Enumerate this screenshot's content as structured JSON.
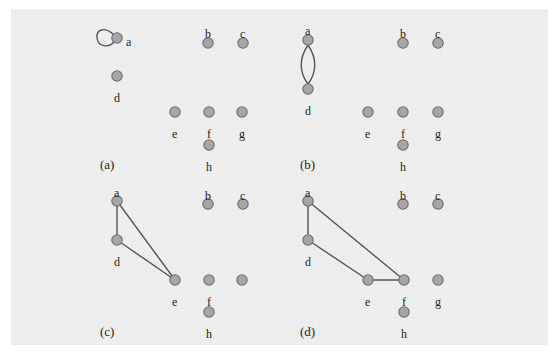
{
  "figure": {
    "background_color": "#eeeeee",
    "page_color": "#ffffff",
    "node_fill": "#a6a6a6",
    "node_stroke": "#6e6e6e",
    "edge_color": "#555555",
    "label_color": "#1c1c1c",
    "node_radius": 5.2,
    "panels": [
      {
        "id": "panel-a",
        "caption": "(a)",
        "caption_x": 100,
        "caption_y": 158,
        "nodes": [
          {
            "id": "a",
            "label": "a",
            "x": 117,
            "y": 38,
            "label_x": 126,
            "label_y": 36,
            "label_visible": true
          },
          {
            "id": "b",
            "label": "b",
            "x": 208,
            "y": 43,
            "label_x": 205,
            "label_y": 28,
            "label_visible": true
          },
          {
            "id": "c",
            "label": "c",
            "x": 243,
            "y": 43,
            "label_x": 240,
            "label_y": 28,
            "label_visible": true
          },
          {
            "id": "d",
            "label": "d",
            "x": 117,
            "y": 76,
            "label_x": 114,
            "label_y": 92,
            "label_visible": true
          },
          {
            "id": "e",
            "label": "e",
            "x": 175,
            "y": 112,
            "label_x": 172,
            "label_y": 128,
            "label_visible": true
          },
          {
            "id": "f",
            "label": "f",
            "x": 209,
            "y": 112,
            "label_x": 207,
            "label_y": 128,
            "label_visible": true
          },
          {
            "id": "g",
            "label": "g",
            "x": 242,
            "y": 112,
            "label_x": 239,
            "label_y": 128,
            "label_visible": true
          },
          {
            "id": "h",
            "label": "h",
            "x": 209,
            "y": 145,
            "label_x": 206,
            "label_y": 161,
            "label_visible": true
          }
        ],
        "edges": [],
        "self_loops": [
          {
            "node": "a",
            "path": "M 113 34 C 104 26, 96 30, 97 38 C 98 47, 109 48, 114 42"
          }
        ],
        "double_edges": []
      },
      {
        "id": "panel-b",
        "caption": "(b)",
        "caption_x": 300,
        "caption_y": 158,
        "nodes": [
          {
            "id": "a",
            "label": "a",
            "x": 308,
            "y": 40,
            "label_x": 305,
            "label_y": 25,
            "label_visible": true
          },
          {
            "id": "b",
            "label": "b",
            "x": 403,
            "y": 43,
            "label_x": 400,
            "label_y": 28,
            "label_visible": true
          },
          {
            "id": "c",
            "label": "c",
            "x": 438,
            "y": 43,
            "label_x": 435,
            "label_y": 28,
            "label_visible": true
          },
          {
            "id": "d",
            "label": "d",
            "x": 308,
            "y": 89,
            "label_x": 305,
            "label_y": 105,
            "label_visible": true
          },
          {
            "id": "e",
            "label": "e",
            "x": 368,
            "y": 112,
            "label_x": 365,
            "label_y": 128,
            "label_visible": true
          },
          {
            "id": "f",
            "label": "f",
            "x": 403,
            "y": 112,
            "label_x": 401,
            "label_y": 128,
            "label_visible": true
          },
          {
            "id": "g",
            "label": "g",
            "x": 438,
            "y": 112,
            "label_x": 435,
            "label_y": 128,
            "label_visible": true
          },
          {
            "id": "h",
            "label": "h",
            "x": 403,
            "y": 145,
            "label_x": 400,
            "label_y": 161,
            "label_visible": true
          }
        ],
        "edges": [],
        "self_loops": [],
        "double_edges": [
          {
            "from": "a",
            "to": "d",
            "path_left": "M 308 45 C 299 58, 299 72, 308 84",
            "path_right": "M 308 45 C 317 58, 317 72, 308 84"
          }
        ]
      },
      {
        "id": "panel-c",
        "caption": "(c)",
        "caption_x": 100,
        "caption_y": 325,
        "nodes": [
          {
            "id": "a",
            "label": "a",
            "x": 117,
            "y": 201,
            "label_x": 114,
            "label_y": 187,
            "label_visible": true
          },
          {
            "id": "b",
            "label": "b",
            "x": 208,
            "y": 204,
            "label_x": 205,
            "label_y": 190,
            "label_visible": true
          },
          {
            "id": "c",
            "label": "c",
            "x": 243,
            "y": 204,
            "label_x": 240,
            "label_y": 190,
            "label_visible": true
          },
          {
            "id": "d",
            "label": "d",
            "x": 117,
            "y": 240,
            "label_x": 114,
            "label_y": 256,
            "label_visible": true
          },
          {
            "id": "e",
            "label": "e",
            "x": 175,
            "y": 280,
            "label_x": 172,
            "label_y": 296,
            "label_visible": true
          },
          {
            "id": "f",
            "label": "f",
            "x": 209,
            "y": 280,
            "label_x": 207,
            "label_y": 296,
            "label_visible": true
          },
          {
            "id": "g",
            "label": "",
            "x": 242,
            "y": 280,
            "label_x": 239,
            "label_y": 296,
            "label_visible": false
          },
          {
            "id": "h",
            "label": "h",
            "x": 209,
            "y": 312,
            "label_x": 206,
            "label_y": 328,
            "label_visible": true
          }
        ],
        "edges": [
          {
            "from": "a",
            "to": "d"
          },
          {
            "from": "a",
            "to": "e"
          },
          {
            "from": "d",
            "to": "e"
          }
        ],
        "self_loops": [],
        "double_edges": []
      },
      {
        "id": "panel-d",
        "caption": "(d)",
        "caption_x": 300,
        "caption_y": 325,
        "nodes": [
          {
            "id": "a",
            "label": "a",
            "x": 308,
            "y": 201,
            "label_x": 305,
            "label_y": 187,
            "label_visible": true
          },
          {
            "id": "b",
            "label": "b",
            "x": 403,
            "y": 204,
            "label_x": 400,
            "label_y": 190,
            "label_visible": true
          },
          {
            "id": "c",
            "label": "c",
            "x": 438,
            "y": 204,
            "label_x": 435,
            "label_y": 190,
            "label_visible": true
          },
          {
            "id": "d",
            "label": "d",
            "x": 308,
            "y": 240,
            "label_x": 305,
            "label_y": 256,
            "label_visible": true
          },
          {
            "id": "e",
            "label": "e",
            "x": 368,
            "y": 280,
            "label_x": 365,
            "label_y": 296,
            "label_visible": true
          },
          {
            "id": "f",
            "label": "f",
            "x": 404,
            "y": 280,
            "label_x": 402,
            "label_y": 296,
            "label_visible": true
          },
          {
            "id": "g",
            "label": "g",
            "x": 438,
            "y": 280,
            "label_x": 435,
            "label_y": 296,
            "label_visible": true
          },
          {
            "id": "h",
            "label": "h",
            "x": 404,
            "y": 312,
            "label_x": 401,
            "label_y": 328,
            "label_visible": true
          }
        ],
        "edges": [
          {
            "from": "a",
            "to": "d"
          },
          {
            "from": "a",
            "to": "f"
          },
          {
            "from": "d",
            "to": "e"
          },
          {
            "from": "e",
            "to": "f"
          }
        ],
        "self_loops": [],
        "double_edges": []
      }
    ]
  }
}
